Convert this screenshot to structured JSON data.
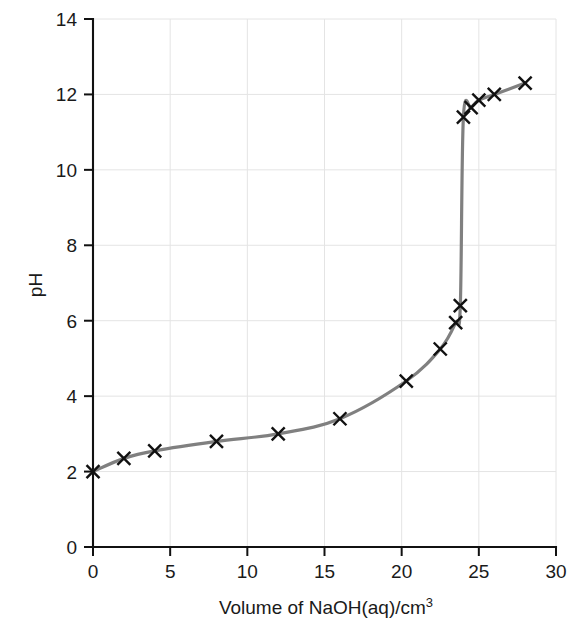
{
  "chart_data": {
    "type": "line",
    "title": "",
    "xlabel": "Volume of NaOH(aq)/cm",
    "xlabel_superscript": "3",
    "ylabel": "pH",
    "xlim": [
      0,
      30
    ],
    "ylim": [
      0,
      14
    ],
    "xticks": [
      0,
      5,
      10,
      15,
      20,
      25,
      30
    ],
    "yticks": [
      0,
      2,
      4,
      6,
      8,
      10,
      12,
      14
    ],
    "xtick_labels": [
      "0",
      "5",
      "10",
      "15",
      "20",
      "25",
      "30"
    ],
    "ytick_labels": [
      "0",
      "2",
      "4",
      "6",
      "8",
      "10",
      "12",
      "14"
    ],
    "grid": true,
    "legend": "none",
    "series": [
      {
        "name": "Titration curve",
        "marker": "x",
        "marker_color": "#111111",
        "line_color": "#808080",
        "x": [
          0,
          2,
          4,
          8,
          12,
          16,
          20.3,
          22.5,
          23.5,
          23.8,
          24.0,
          24.5,
          25.0,
          26.0,
          28.0
        ],
        "y": [
          2.0,
          2.35,
          2.55,
          2.8,
          3.0,
          3.4,
          4.4,
          5.25,
          5.95,
          6.4,
          11.4,
          11.65,
          11.85,
          12.0,
          12.3
        ]
      }
    ],
    "colors": {
      "line": "#808080",
      "marker": "#111111",
      "axis": "#111111",
      "grid": "#e4e4e4",
      "background": "#ffffff"
    }
  }
}
